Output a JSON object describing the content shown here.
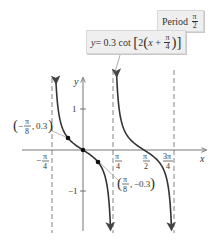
{
  "equation_box": {
    "y_label": "y",
    "equals": " = 0.3 cot",
    "inner_coeff": "2",
    "x_var": "x",
    "plus": " + ",
    "pi_num": "π",
    "pi_den": "4"
  },
  "period_box": {
    "label": "Period",
    "pi_num": "π",
    "pi_den": "2"
  },
  "axes": {
    "x_label": "x",
    "y_label": "y",
    "y_ticks": [
      {
        "value": 1,
        "label": "1"
      },
      {
        "value": -1,
        "label": "−1"
      }
    ],
    "x_ticks": [
      {
        "value": "-π/4",
        "num": "π",
        "den": "4",
        "sign": "−"
      },
      {
        "value": "π/4",
        "num": "π",
        "den": "4",
        "sign": ""
      },
      {
        "value": "π/2",
        "num": "π",
        "den": "2",
        "sign": ""
      },
      {
        "value": "3π/4",
        "num": "3π",
        "den": "4",
        "sign": ""
      }
    ]
  },
  "points": [
    {
      "label": "(−π/8, 0.3)",
      "x_num": "π",
      "x_den": "8",
      "x_sign": "−",
      "y": "0.3"
    },
    {
      "label": "(π/8, −0.3)",
      "x_num": "π",
      "x_den": "8",
      "x_sign": "",
      "y": "−0.3"
    }
  ],
  "colors": {
    "curve": "#333333",
    "axis": "#666666",
    "asymptote": "#777777",
    "box_bg": "#efefef"
  },
  "chart_data": {
    "type": "line",
    "annotation": "Period π/2",
    "xlabel": "x",
    "ylabel": "y",
    "xlim": [
      -0.95,
      2.6
    ],
    "ylim": [
      -1.95,
      1.75
    ],
    "asymptotes_x": [
      "-π/4",
      "π/4",
      "3π/4"
    ],
    "x_ticks": [
      "-π/4",
      "π/4",
      "π/2",
      "3π/4"
    ],
    "y_ticks": [
      -1,
      1
    ],
    "series": [
      {
        "name": "branch 1",
        "domain": "(-π/4, π/4)",
        "formula": "y = 0.3 cot(2(x+π/4))",
        "points": [
          [
            -0.3927,
            0.3
          ],
          [
            0,
            0
          ],
          [
            0.3927,
            -0.3
          ]
        ]
      },
      {
        "name": "branch 2",
        "domain": "(π/4, 3π/4)",
        "formula": "y = 0.3 cot(2(x+π/4))",
        "points": [
          [
            1.1781,
            0.3
          ],
          [
            1.5708,
            0
          ],
          [
            1.9635,
            -0.3
          ]
        ]
      }
    ],
    "marked_points": [
      [
        -0.3927,
        0.3
      ],
      [
        0,
        0
      ],
      [
        0.3927,
        -0.3
      ]
    ],
    "grid": false
  }
}
